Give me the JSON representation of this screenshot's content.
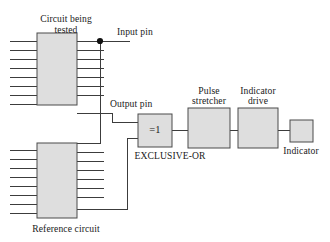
{
  "diagram": {
    "colors": {
      "background": "#ffffff",
      "block_fill": "#dedede",
      "block_stroke": "#4a4a4a",
      "wire": "#3c3c3c",
      "text": "#1a1a1a"
    },
    "labels": {
      "circuit_being_tested_line1": "Circuit being",
      "circuit_being_tested_line2": "tested",
      "reference_circuit": "Reference circuit",
      "input_pin": "Input pin",
      "output_pin": "Output pin",
      "xor_symbol": "=1",
      "xor_caption": "EXCLUSIVE-OR",
      "pulse_stretcher_line1": "Pulse",
      "pulse_stretcher_line2": "stretcher",
      "indicator_drive_line1": "Indicator",
      "indicator_drive_line2": "drive",
      "indicator": "Indicator"
    },
    "blocks": [
      {
        "id": "dut",
        "label": "Circuit being tested",
        "pins_left": 8,
        "pins_right": 8
      },
      {
        "id": "reference",
        "label": "Reference circuit",
        "pins_left": 8,
        "pins_right": 8
      },
      {
        "id": "xor",
        "label": "=1",
        "caption": "EXCLUSIVE-OR"
      },
      {
        "id": "pulse-stretcher",
        "label": "Pulse stretcher"
      },
      {
        "id": "indicator-drive",
        "label": "Indicator drive"
      },
      {
        "id": "indicator",
        "label": "Indicator"
      }
    ],
    "nodes": [
      {
        "id": "input-pin-junction",
        "type": "junction-dot"
      }
    ]
  }
}
